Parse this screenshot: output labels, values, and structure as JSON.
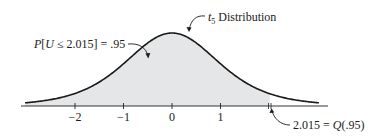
{
  "chart_data": {
    "type": "area",
    "title": "t5 Distribution",
    "distribution": "Student t",
    "degrees_of_freedom": 5,
    "xlabel": "",
    "ylabel": "",
    "xlim": [
      -3,
      3
    ],
    "x_ticks": [
      -2,
      -1,
      0,
      1
    ],
    "x_tick_labels": [
      "−2",
      "−1",
      "0",
      "1"
    ],
    "shaded_region": {
      "from": -3,
      "to": 2.015,
      "probability": 0.95
    },
    "quantile": {
      "p": 0.95,
      "value": 2.015
    },
    "grid": false,
    "legend": null,
    "annotations": [
      {
        "text": "t5 Distribution",
        "points_to": "curve near peak"
      },
      {
        "text": "P[U ≤ 2.015] = .95",
        "points_to": "shaded area"
      },
      {
        "text": "2.015 = Q(.95)",
        "points_to": "axis at x = 2.015"
      }
    ],
    "colors": {
      "curve": "#1a1a1a",
      "fill": "#e4e6e7",
      "axis": "#333333"
    }
  },
  "labels": {
    "dist_t": "t",
    "dist_sub": "5",
    "dist_rest": " Distribution",
    "prob_P": "P",
    "prob_open": "[",
    "prob_U": "U",
    "prob_rest": " ≤ 2.015] = .95",
    "q_value": "2.015 = ",
    "q_Q": "Q",
    "q_arg": "(.95)"
  },
  "ticks": [
    {
      "label": "−2"
    },
    {
      "label": "−1"
    },
    {
      "label": "0"
    },
    {
      "label": "1"
    }
  ]
}
